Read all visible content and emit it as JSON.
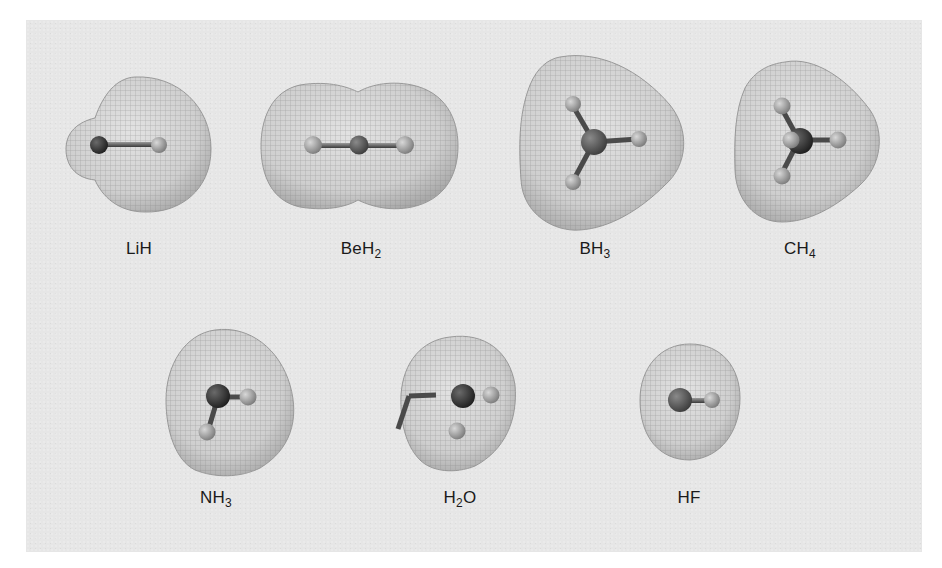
{
  "figure": {
    "background_color": "#e6e6e6",
    "surface_color": "#c9c9c9",
    "mesh_color": "#8a8a8a",
    "central_atom_color": "#3a3a3a",
    "hydrogen_atom_color": "#a9a9a9",
    "rows": [
      {
        "molecules": [
          {
            "id": "LiH",
            "label_main": "LiH",
            "label_sub": "",
            "label_after": ""
          },
          {
            "id": "BeH2",
            "label_main": "BeH",
            "label_sub": "2",
            "label_after": ""
          },
          {
            "id": "BH3",
            "label_main": "BH",
            "label_sub": "3",
            "label_after": ""
          },
          {
            "id": "CH4",
            "label_main": "CH",
            "label_sub": "4",
            "label_after": ""
          }
        ]
      },
      {
        "molecules": [
          {
            "id": "NH3",
            "label_main": "NH",
            "label_sub": "3",
            "label_after": ""
          },
          {
            "id": "H2O",
            "label_main": "H",
            "label_sub": "2",
            "label_after": "O"
          },
          {
            "id": "HF",
            "label_main": "HF",
            "label_sub": "",
            "label_after": ""
          }
        ]
      }
    ]
  }
}
